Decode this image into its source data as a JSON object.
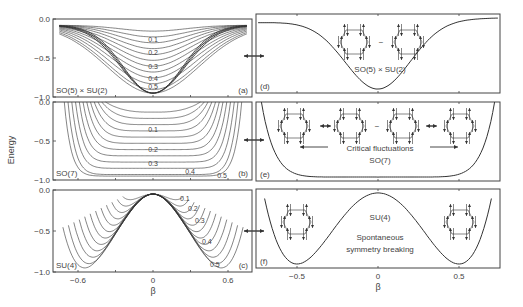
{
  "figure": {
    "ylabel": "Energy",
    "xlabel": "β",
    "colors": {
      "line": "#333333",
      "frame": "#444444",
      "text": "#444444"
    }
  },
  "chart_data": [
    {
      "panel": "a",
      "type": "line",
      "label": "(a)",
      "group": "SO(5) × SU(2)",
      "xlim": [
        -0.8,
        0.8
      ],
      "ylim": [
        -1.0,
        0.0
      ],
      "yticks": [
        "0.0",
        "-0.5",
        "-1.0"
      ],
      "curve_labels": [
        "0.1",
        "0.2",
        "0.3",
        "0.4",
        "0.5"
      ],
      "description": "Family of bell-shaped wells, depth increasing with parameter 0.1–0.5, converging near -0.95 at β=0"
    },
    {
      "panel": "b",
      "type": "line",
      "label": "(b)",
      "group": "SO(7)",
      "xlim": [
        -0.8,
        0.8
      ],
      "ylim": [
        -1.0,
        0.0
      ],
      "yticks": [
        "0.0",
        "-0.5",
        "-1.0"
      ],
      "curve_labels": [
        "0.1",
        "0.2",
        "0.3",
        "0.4",
        "0.5"
      ],
      "description": "Family of U-shaped wells flattening toward a flat bottom at -0.95"
    },
    {
      "panel": "c",
      "type": "line",
      "label": "(c)",
      "group": "SU(4)",
      "xlim": [
        -0.8,
        0.8
      ],
      "ylim": [
        -1.0,
        0.0
      ],
      "yticks": [
        "0.0",
        "-0.5",
        "-1.0"
      ],
      "xticks": [
        "-0.6",
        "0",
        "0.6"
      ],
      "curve_labels": [
        "0.1",
        "0.2",
        "0.3",
        "0.4",
        "0.5"
      ],
      "description": "Double-well curves with maximum near 0 at β=0 and minima deepening to -0.95 at |β|≈0.5"
    },
    {
      "panel": "d",
      "type": "line",
      "label": "(d)",
      "group": "SO(5) × SU(2)",
      "description": "Single bell-shaped well, minimum ≈ -0.95 at β=0"
    },
    {
      "panel": "e",
      "type": "line",
      "label": "(e)",
      "group": "SO(7)",
      "annotation": "Critical fluctuations",
      "description": "Flat-bottomed well spanning roughly β ∈ [-0.5, 0.5]"
    },
    {
      "panel": "f",
      "type": "line",
      "label": "(f)",
      "group": "SU(4)",
      "annotation": "Spontaneous symmetry breaking",
      "xticks": [
        "-0.5",
        "0",
        "0.5"
      ],
      "description": "Double well, minima ≈ -0.95 at β=±0.5, maximum ≈ -0.05 at β=0"
    }
  ]
}
